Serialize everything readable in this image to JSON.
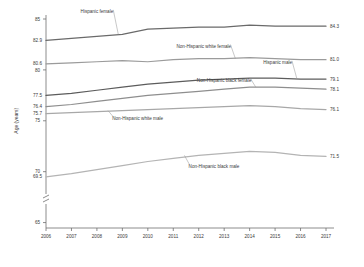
{
  "chart_data": {
    "type": "line",
    "title": "",
    "xlabel": "",
    "ylabel": "Age (years)",
    "x": [
      2006,
      2007,
      2008,
      2009,
      2010,
      2011,
      2012,
      2013,
      2014,
      2015,
      2016,
      2017
    ],
    "xtick_labels": [
      "2006",
      "2007",
      "2008",
      "2009",
      "2010",
      "2011",
      "2012",
      "2013",
      "2014",
      "2015",
      "2016",
      "2017"
    ],
    "ytick_labels": [
      "85",
      "80",
      "75",
      "70",
      "65"
    ],
    "ytick_values": [
      85,
      80,
      75,
      70,
      65
    ],
    "ylim": [
      63.5,
      85
    ],
    "xlim": [
      2006,
      2017
    ],
    "grid": false,
    "legend": "inline-labels",
    "axis_break": true,
    "series": [
      {
        "name": "Hispanic female",
        "color": "#6a6a6a",
        "start_value": "82.9",
        "end_value": "84.3",
        "values": [
          82.9,
          83.1,
          83.3,
          83.5,
          84.0,
          84.1,
          84.2,
          84.2,
          84.4,
          84.3,
          84.3,
          84.3
        ],
        "label_x": 2008.0,
        "label_y": 85.6
      },
      {
        "name": "Non-Hispanic white female",
        "color": "#9b9b9b",
        "start_value": "80.6",
        "end_value": "81.0",
        "values": [
          80.6,
          80.7,
          80.8,
          80.9,
          80.8,
          81.0,
          81.1,
          81.1,
          81.2,
          81.1,
          81.0,
          81.0
        ],
        "label_x": 2012.2,
        "label_y": 82.2
      },
      {
        "name": "Hispanic male",
        "color": "#5c5c5c",
        "start_value": "77.5",
        "end_value": "79.1",
        "values": [
          77.5,
          77.7,
          78.0,
          78.3,
          78.6,
          78.8,
          79.0,
          79.1,
          79.2,
          79.2,
          79.1,
          79.1
        ],
        "label_x": 2015.1,
        "label_y": 80.6
      },
      {
        "name": "Non-Hispanic black female",
        "color": "#8e8e8e",
        "start_value": "76.4",
        "end_value": "78.1",
        "values": [
          76.4,
          76.6,
          76.9,
          77.2,
          77.5,
          77.7,
          77.9,
          78.1,
          78.3,
          78.3,
          78.2,
          78.1
        ],
        "label_x": 2013.0,
        "label_y": 78.8
      },
      {
        "name": "Non-Hispanic white male",
        "color": "#a8a8a8",
        "start_value": "75.7",
        "end_value": "76.1",
        "values": [
          75.7,
          75.8,
          75.9,
          76.0,
          76.1,
          76.2,
          76.3,
          76.4,
          76.5,
          76.4,
          76.2,
          76.1
        ],
        "label_x": 2009.6,
        "label_y": 75.1
      },
      {
        "name": "Non-Hispanic black male",
        "color": "#b4b4b4",
        "start_value": "69.5",
        "end_value": "71.5",
        "values": [
          69.5,
          69.8,
          70.2,
          70.6,
          71.0,
          71.3,
          71.6,
          71.8,
          72.0,
          71.9,
          71.6,
          71.5
        ],
        "label_x": 2012.6,
        "label_y": 70.4
      }
    ]
  }
}
